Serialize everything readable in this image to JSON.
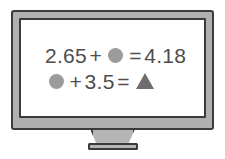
{
  "device": {
    "type": "monitor",
    "frame_color": "#3b3b3b",
    "bezel_color": "#b0b0b0",
    "screen_color": "#ffffff",
    "stand_label": "monitor-stand"
  },
  "screen": {
    "text_color": "#4d4d4d",
    "shape_colors": {
      "circle": "#9b9b9b",
      "triangle": "#6e6e6e"
    },
    "equations": [
      {
        "id": "equation-1",
        "tokens": [
          {
            "kind": "number",
            "text": "2.65"
          },
          {
            "kind": "operator",
            "text": "+"
          },
          {
            "kind": "shape",
            "shape": "circle",
            "name": "gray-circle-icon"
          },
          {
            "kind": "operator",
            "text": "="
          },
          {
            "kind": "number",
            "text": "4.18"
          }
        ],
        "plain_text": "2.65 + ● = 4.18"
      },
      {
        "id": "equation-2",
        "tokens": [
          {
            "kind": "shape",
            "shape": "circle",
            "name": "gray-circle-icon"
          },
          {
            "kind": "operator",
            "text": "+"
          },
          {
            "kind": "number",
            "text": "3.5"
          },
          {
            "kind": "operator",
            "text": "="
          },
          {
            "kind": "shape",
            "shape": "triangle",
            "name": "gray-triangle-icon"
          }
        ],
        "plain_text": "● + 3.5 = ▲"
      }
    ]
  }
}
